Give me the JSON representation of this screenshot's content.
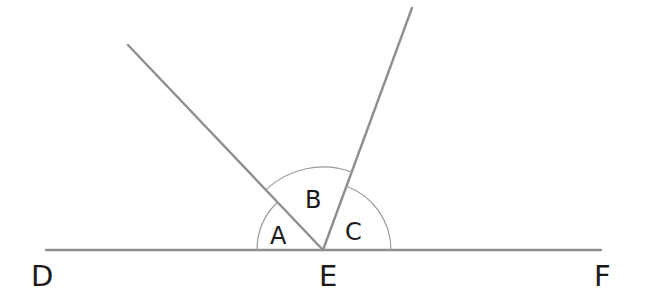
{
  "diagram": {
    "type": "angles-on-a-straight-line",
    "colors": {
      "line": "#8f8f8f",
      "arc": "#9a9a9a",
      "text": "#1a1a1a",
      "background": "#ffffff"
    },
    "points": {
      "D": {
        "label": "D"
      },
      "E": {
        "label": "E"
      },
      "F": {
        "label": "F"
      }
    },
    "angles": [
      {
        "label": "A"
      },
      {
        "label": "B"
      },
      {
        "label": "C"
      }
    ]
  }
}
